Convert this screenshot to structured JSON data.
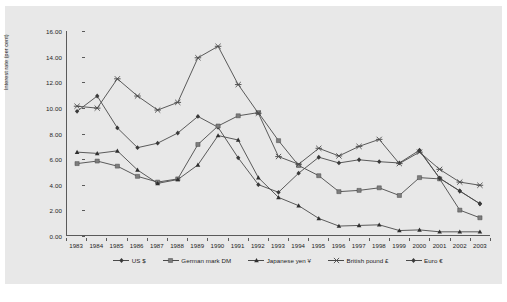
{
  "figure": {
    "background_color": "#e8e8e8",
    "line_color": "#4a4a4a",
    "axis_color": "#5a5a5a",
    "caption": ""
  },
  "chart_data": {
    "type": "line",
    "title": "",
    "xlabel": "",
    "ylabel": "Interest rate (per cent)",
    "ylim": [
      0,
      16
    ],
    "ytick_labels": [
      "0.00",
      "2.00",
      "4.00",
      "6.00",
      "8.00",
      "10.00",
      "12.00",
      "14.00",
      "16.00"
    ],
    "ytick_values": [
      0,
      2,
      4,
      6,
      8,
      10,
      12,
      14,
      16
    ],
    "grid": false,
    "legend_position": "bottom",
    "categories": [
      "1983",
      "1984",
      "1985",
      "1986",
      "1987",
      "1988",
      "1989",
      "1990",
      "1991",
      "1992",
      "1993",
      "1994",
      "1995",
      "1996",
      "1997",
      "1998",
      "1999",
      "2000",
      "2001",
      "2002",
      "2003"
    ],
    "series": [
      {
        "name": "US $",
        "marker": "diamond",
        "values": [
          9.7,
          10.9,
          8.4,
          6.85,
          7.2,
          8.0,
          9.3,
          8.45,
          6.05,
          3.95,
          3.35,
          4.85,
          6.1,
          5.65,
          5.9,
          5.75,
          5.65,
          6.65,
          4.45,
          3.45,
          2.45
        ]
      },
      {
        "name": "German mark DM",
        "marker": "square",
        "values": [
          5.6,
          5.8,
          5.4,
          4.6,
          4.15,
          4.4,
          7.1,
          8.55,
          9.35,
          9.6,
          7.4,
          5.45,
          4.65,
          3.4,
          3.5,
          3.7,
          3.1,
          4.5,
          4.4,
          1.95,
          1.35
        ]
      },
      {
        "name": "Japanese yen ¥",
        "marker": "triangle",
        "values": [
          6.5,
          6.4,
          6.6,
          5.1,
          4.05,
          4.35,
          5.5,
          7.8,
          7.45,
          4.5,
          2.95,
          2.3,
          1.3,
          0.7,
          0.75,
          0.8,
          0.35,
          0.4,
          0.25,
          0.25,
          0.25
        ]
      },
      {
        "name": "British pound £",
        "marker": "x",
        "values": [
          10.1,
          9.95,
          12.25,
          10.9,
          9.8,
          10.4,
          13.9,
          14.8,
          11.8,
          9.55,
          6.15,
          5.55,
          6.8,
          6.2,
          6.95,
          7.5,
          5.6,
          6.5,
          5.15,
          4.15,
          3.9
        ]
      },
      {
        "name": "Euro €",
        "marker": "diamond-filled",
        "values": [
          null,
          null,
          null,
          null,
          null,
          null,
          null,
          null,
          null,
          null,
          null,
          null,
          null,
          null,
          null,
          null,
          null,
          6.6,
          4.45,
          3.45,
          2.45
        ]
      }
    ]
  }
}
